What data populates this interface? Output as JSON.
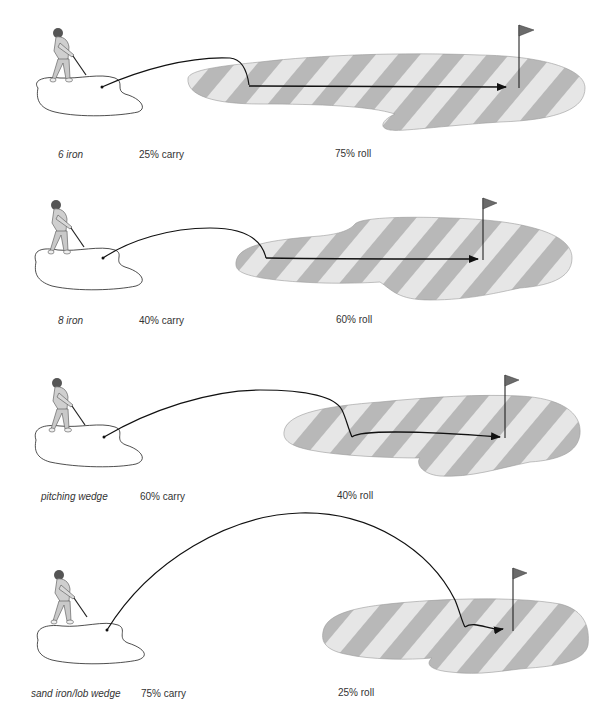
{
  "colors": {
    "stripe_dark": "#b5b5b5",
    "stripe_light": "#e6e6e6",
    "line": "#111111",
    "flag": "#6b6b6b",
    "label_text": "#333333"
  },
  "panels": [
    {
      "club": "6 iron",
      "carry": "25% carry",
      "roll": "75% roll",
      "carry_pct": 25,
      "roll_pct": 75
    },
    {
      "club": "8 iron",
      "carry": "40% carry",
      "roll": "60% roll",
      "carry_pct": 40,
      "roll_pct": 60
    },
    {
      "club": "pitching wedge",
      "carry": "60% carry",
      "roll": "40% roll",
      "carry_pct": 60,
      "roll_pct": 40
    },
    {
      "club": "sand iron/lob wedge",
      "carry": "75% carry",
      "roll": "25% roll",
      "carry_pct": 75,
      "roll_pct": 25
    }
  ],
  "icons": {
    "golfer": "golfer-icon",
    "flag": "flag-icon",
    "arrow": "arrow-icon"
  }
}
